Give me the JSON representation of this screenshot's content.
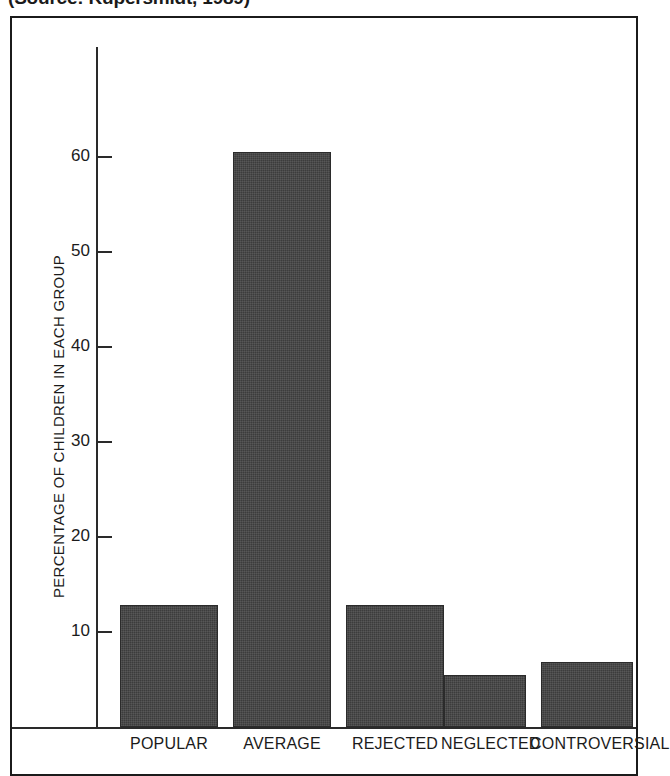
{
  "source_caption": "(Source: Kupersmidt, 1989)",
  "chart_data": {
    "type": "bar",
    "title": "",
    "xlabel": "",
    "ylabel": "PERCENTAGE OF CHILDREN IN EACH GROUP",
    "categories": [
      "POPULAR",
      "AVERAGE",
      "REJECTED",
      "NEGLECTED",
      "CONTROVERSIAL"
    ],
    "values": [
      12.8,
      60.5,
      12.8,
      5.5,
      6.8
    ],
    "ylim": [
      0,
      68
    ],
    "yticks": [
      10,
      20,
      30,
      40,
      50,
      60
    ],
    "ytick_labels": [
      "10",
      "20",
      "30",
      "40",
      "50",
      "60"
    ],
    "grid": false,
    "legend": "none",
    "bar_color": "#3c3c3c",
    "axis_color": "#2a2a2a",
    "frame_color": "#1b1b1b"
  }
}
